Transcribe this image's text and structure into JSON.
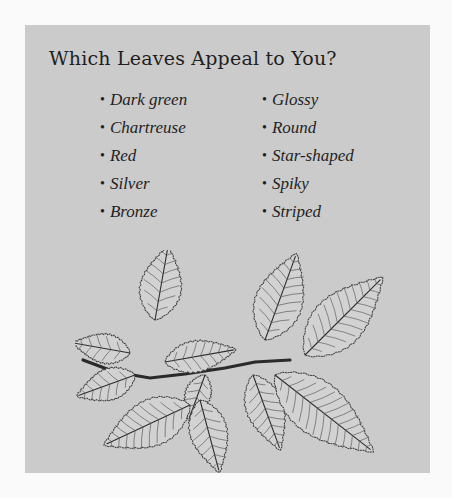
{
  "panel": {
    "background": "#cbcbcb",
    "page_background": "#fafafa",
    "text_color": "#1f1f1f"
  },
  "title": "Which Leaves Appeal to You?",
  "bullet_glyph": "•",
  "lists": {
    "left": [
      {
        "label": "Dark green"
      },
      {
        "label": "Chartreuse"
      },
      {
        "label": "Red"
      },
      {
        "label": "Silver"
      },
      {
        "label": "Bronze"
      }
    ],
    "right": [
      {
        "label": "Glossy"
      },
      {
        "label": "Round"
      },
      {
        "label": "Star-shaped"
      },
      {
        "label": "Spiky"
      },
      {
        "label": "Striped"
      }
    ]
  },
  "illustration": {
    "subject": "leafy-branch-line-drawing",
    "stem_points": "8,110 40,122 75,128 110,124 150,118 180,112 215,110",
    "leaves": [
      {
        "name": "leaf-top-left",
        "x": 80,
        "y": 70,
        "length": 75,
        "width": 40,
        "angle": -80
      },
      {
        "name": "leaf-mid-left-small",
        "x": 55,
        "y": 103,
        "length": 58,
        "width": 28,
        "angle": -170
      },
      {
        "name": "leaf-center-horizontal",
        "x": 90,
        "y": 112,
        "length": 72,
        "width": 30,
        "angle": -10
      },
      {
        "name": "leaf-top-center-tall",
        "x": 190,
        "y": 90,
        "length": 92,
        "width": 46,
        "angle": -70
      },
      {
        "name": "leaf-top-right-large",
        "x": 230,
        "y": 105,
        "length": 110,
        "width": 50,
        "angle": -45
      },
      {
        "name": "leaf-lower-left-mid",
        "x": 60,
        "y": 125,
        "length": 62,
        "width": 30,
        "angle": 160
      },
      {
        "name": "leaf-lower-center-small",
        "x": 130,
        "y": 125,
        "length": 48,
        "width": 24,
        "angle": 110
      },
      {
        "name": "leaf-bottom-left-large",
        "x": 115,
        "y": 155,
        "length": 95,
        "width": 45,
        "angle": 155
      },
      {
        "name": "leaf-bottom-center",
        "x": 125,
        "y": 150,
        "length": 75,
        "width": 36,
        "angle": 75
      },
      {
        "name": "leaf-bottom-center-right",
        "x": 178,
        "y": 125,
        "length": 80,
        "width": 36,
        "angle": 70
      },
      {
        "name": "leaf-bottom-right-large",
        "x": 200,
        "y": 125,
        "length": 125,
        "width": 52,
        "angle": 38
      }
    ]
  }
}
